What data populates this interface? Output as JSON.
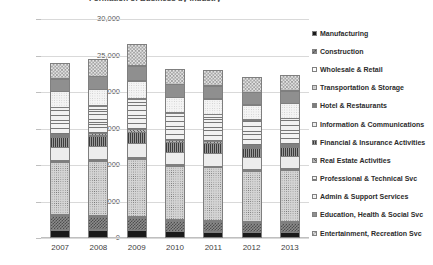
{
  "chart_data": {
    "type": "bar",
    "subtype": "stacked-column",
    "title": "Formation of Business by Industry",
    "xlabel": "",
    "ylabel": "",
    "ylim": [
      0,
      30000
    ],
    "ytick_labels": [
      "30,000",
      "25,000",
      "20,000",
      "15,000",
      "10,000",
      "5,000",
      "0"
    ],
    "ytick_values": [
      30000,
      25000,
      20000,
      15000,
      10000,
      5000,
      0
    ],
    "grid": true,
    "legend_position": "right",
    "categories": [
      "2007",
      "2008",
      "2009",
      "2010",
      "2011",
      "2012",
      "2013"
    ],
    "totals": [
      24900,
      25200,
      27500,
      24000,
      23900,
      22900,
      23100
    ],
    "series": [
      {
        "name": "Manufacturing",
        "pattern": "solid-black",
        "values": [
          1150,
          1150,
          1100,
          900,
          850,
          800,
          800
        ]
      },
      {
        "name": "Construction",
        "pattern": "check-dark",
        "values": [
          1900,
          1850,
          1700,
          1500,
          1450,
          1350,
          1400
        ]
      },
      {
        "name": "Wholesale & Retail",
        "pattern": "white",
        "values": [
          300,
          300,
          300,
          250,
          250,
          250,
          250
        ]
      },
      {
        "name": "Transportation  & Storage",
        "pattern": "dots-mid",
        "values": [
          7300,
          7500,
          8000,
          7400,
          7350,
          7000,
          7050
        ]
      },
      {
        "name": "Hotel & Restaurants",
        "pattern": "grey-solid",
        "values": [
          300,
          300,
          300,
          250,
          250,
          250,
          250
        ]
      },
      {
        "name": "Information & Communications",
        "pattern": "dots-fine",
        "values": [
          1900,
          1900,
          2000,
          1850,
          1800,
          1750,
          1800
        ]
      },
      {
        "name": "Financial & Insurance Activities",
        "pattern": "hatch-dark",
        "values": [
          1500,
          1500,
          1600,
          1450,
          1450,
          1400,
          1400
        ]
      },
      {
        "name": "Real Estate Activities",
        "pattern": "hatch-diag",
        "values": [
          400,
          400,
          450,
          350,
          350,
          350,
          350
        ]
      },
      {
        "name": "Professional & Technical Svc",
        "pattern": "lines-h",
        "values": [
          3800,
          3900,
          4300,
          3800,
          3800,
          3650,
          3700
        ]
      },
      {
        "name": "Admin & Support Services",
        "pattern": "vlight",
        "values": [
          2300,
          2350,
          2550,
          2250,
          2250,
          2150,
          2150
        ]
      },
      {
        "name": "Education, Health & Social Svc",
        "pattern": "grey-mid",
        "values": [
          1800,
          1850,
          2100,
          1850,
          1850,
          1800,
          1800
        ]
      },
      {
        "name": "Entertainment, Recreation Svc",
        "pattern": "check-light",
        "values": [
          2250,
          2400,
          3100,
          2150,
          2200,
          2150,
          2250
        ]
      }
    ]
  },
  "legend": {
    "items": [
      {
        "label": "Manufacturing"
      },
      {
        "label": "Construction"
      },
      {
        "label": "Wholesale & Retail"
      },
      {
        "label": "Transportation  & Storage"
      },
      {
        "label": "Hotel & Restaurants"
      },
      {
        "label": "Information & Communications"
      },
      {
        "label": "Financial & Insurance Activities"
      },
      {
        "label": "Real Estate Activities"
      },
      {
        "label": "Professional & Technical Svc"
      },
      {
        "label": "Admin & Support Services"
      },
      {
        "label": "Education, Health & Social Svc"
      },
      {
        "label": "Entertainment, Recreation Svc"
      }
    ]
  }
}
